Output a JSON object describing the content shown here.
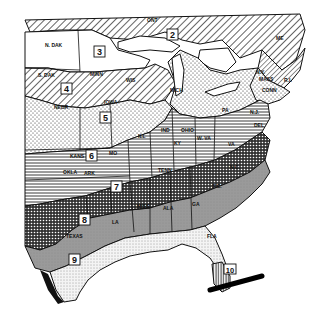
{
  "map": {
    "title": "",
    "zones": [
      {
        "id": "2",
        "label": "2"
      },
      {
        "id": "3",
        "label": "3"
      },
      {
        "id": "4",
        "label": "4"
      },
      {
        "id": "5",
        "label": "5"
      },
      {
        "id": "6",
        "label": "6"
      },
      {
        "id": "7",
        "label": "7"
      },
      {
        "id": "8",
        "label": "8"
      },
      {
        "id": "9",
        "label": "9"
      },
      {
        "id": "10",
        "label": "10"
      }
    ],
    "states": {
      "ndak": "N. DAK",
      "sdak": "S. DAK",
      "nebr": "NEBR",
      "minn": "MINN",
      "wis": "WIS",
      "iowa": "IOWA",
      "ill": "ILL",
      "ind": "IND",
      "ohio": "OHIO",
      "mich": "MICH",
      "pa": "PA",
      "ny": "N.Y.",
      "me": "ME",
      "mass": "MASS",
      "conn": "CONN",
      "ri": "R.I.",
      "nj": "N.J.",
      "del": "DEL",
      "md": "MD",
      "wva": "W. VA",
      "va": "VA",
      "ky": "KY",
      "tenn": "TENN",
      "nc": "N.C.",
      "sc": "S.C.",
      "ga": "GA",
      "ala": "ALA",
      "miss": "MISS",
      "la": "LA",
      "ark": "ARK",
      "mo": "MO",
      "kans": "KANS",
      "okla": "OKLA",
      "texas": "TEXAS",
      "fla": "FLA",
      "ont": "ONT"
    }
  }
}
